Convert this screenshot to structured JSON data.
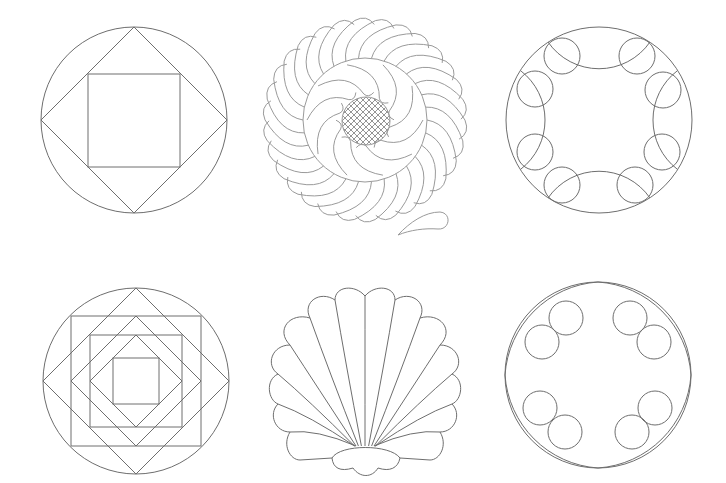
{
  "sheet": {
    "background": "#ffffff",
    "line_color_dark": "#6e6e6e",
    "line_color_light": "#9a9a9a",
    "patterns": [
      {
        "id": "square-in-diamond-in-circle",
        "name": "Square in a square circle",
        "row": 1,
        "col": 1,
        "center": [
          134,
          120
        ],
        "radius": 93
      },
      {
        "id": "feathered-wreath",
        "name": "Feathered wreath with crosshatch center",
        "row": 1,
        "col": 2,
        "center": [
          365,
          120
        ],
        "feather_count": 30,
        "inner_feather_count": 10,
        "hatch_radius": 24
      },
      {
        "id": "four-arc-eight-circle",
        "name": "Circle with four arcs and eight small circles",
        "row": 1,
        "col": 3,
        "center": [
          599,
          120
        ],
        "radius": 93,
        "small_circle_count": 8
      },
      {
        "id": "nested-squares-diamonds",
        "name": "Nested squares and diamonds in circle",
        "row": 2,
        "col": 1,
        "center": [
          136,
          381
        ],
        "radius": 93
      },
      {
        "id": "clam-shell",
        "name": "Scallop shell",
        "row": 2,
        "col": 2,
        "lobes": 10
      },
      {
        "id": "ring-eight-circles",
        "name": "Circle with inner arcs and eight small circles",
        "row": 2,
        "col": 3,
        "center": [
          598,
          375
        ],
        "radius": 93,
        "small_circle_count": 8
      }
    ]
  }
}
